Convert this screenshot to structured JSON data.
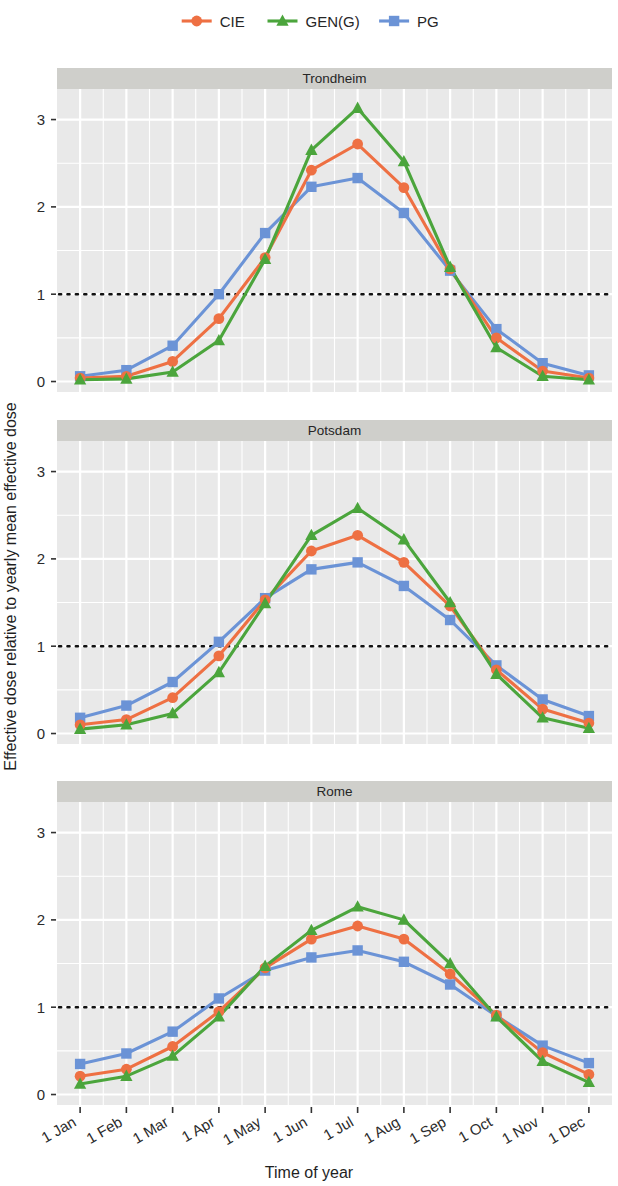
{
  "chart_data": {
    "type": "line",
    "title": "",
    "xlabel": "Time of year",
    "ylabel": "Effective dose relative to yearly mean effective dose",
    "categories": [
      "1 Jan",
      "1 Feb",
      "1 Mar",
      "1 Apr",
      "1 May",
      "1 Jun",
      "1 Jul",
      "1 Aug",
      "1 Sep",
      "1 Oct",
      "1 Nov",
      "1 Dec"
    ],
    "ytick_labels": [
      "0",
      "1",
      "2",
      "3"
    ],
    "ytick_values": [
      0,
      1,
      2,
      3
    ],
    "ylim": [
      -0.12,
      3.35
    ],
    "grid": true,
    "legend_position": "top",
    "reference_line": {
      "y": 1,
      "style": "dotted"
    },
    "colors": {
      "CIE": "#ee7043",
      "GEN(G)": "#4ba53c",
      "PG": "#6b93d6"
    },
    "markers": {
      "CIE": "circle",
      "GEN(G)": "triangle",
      "PG": "square"
    },
    "legend": [
      "CIE",
      "GEN(G)",
      "PG"
    ],
    "panels": [
      {
        "name": "Trondheim",
        "series": [
          {
            "name": "CIE",
            "values": [
              0.04,
              0.06,
              0.23,
              0.72,
              1.42,
              2.42,
              2.72,
              2.22,
              1.29,
              0.5,
              0.12,
              0.04
            ]
          },
          {
            "name": "GEN(G)",
            "values": [
              0.02,
              0.03,
              0.11,
              0.47,
              1.4,
              2.65,
              3.13,
              2.52,
              1.31,
              0.39,
              0.06,
              0.02
            ]
          },
          {
            "name": "PG",
            "values": [
              0.06,
              0.13,
              0.41,
              1.0,
              1.7,
              2.23,
              2.33,
              1.93,
              1.27,
              0.6,
              0.21,
              0.07
            ]
          }
        ]
      },
      {
        "name": "Potsdam",
        "series": [
          {
            "name": "CIE",
            "values": [
              0.1,
              0.16,
              0.41,
              0.89,
              1.53,
              2.09,
              2.27,
              1.96,
              1.46,
              0.73,
              0.28,
              0.12
            ]
          },
          {
            "name": "GEN(G)",
            "values": [
              0.05,
              0.1,
              0.23,
              0.7,
              1.49,
              2.27,
              2.58,
              2.22,
              1.5,
              0.68,
              0.18,
              0.06
            ]
          },
          {
            "name": "PG",
            "values": [
              0.18,
              0.32,
              0.59,
              1.05,
              1.55,
              1.88,
              1.96,
              1.69,
              1.3,
              0.78,
              0.39,
              0.2
            ]
          }
        ]
      },
      {
        "name": "Rome",
        "series": [
          {
            "name": "CIE",
            "values": [
              0.21,
              0.29,
              0.55,
              0.95,
              1.45,
              1.78,
              1.93,
              1.78,
              1.38,
              0.91,
              0.48,
              0.23
            ]
          },
          {
            "name": "GEN(G)",
            "values": [
              0.12,
              0.21,
              0.44,
              0.89,
              1.47,
              1.88,
              2.15,
              2.0,
              1.5,
              0.89,
              0.38,
              0.14
            ]
          },
          {
            "name": "PG",
            "values": [
              0.35,
              0.47,
              0.72,
              1.1,
              1.42,
              1.57,
              1.65,
              1.52,
              1.26,
              0.9,
              0.56,
              0.36
            ]
          }
        ]
      }
    ]
  }
}
